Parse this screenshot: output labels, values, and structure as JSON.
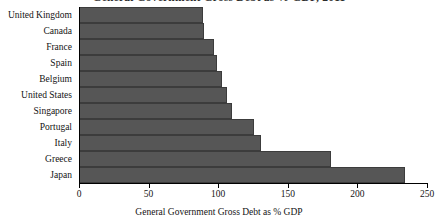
{
  "chart_data": {
    "type": "bar",
    "orientation": "horizontal",
    "title": "General Government Gross Debt as % GDP, 2011",
    "title_clipped": true,
    "categories": [
      "United Kingdom",
      "Canada",
      "France",
      "Spain",
      "Belgium",
      "United States",
      "Singapore",
      "Portugal",
      "Italy",
      "Greece",
      "Japan"
    ],
    "values": [
      89,
      90,
      97,
      99,
      103,
      106,
      110,
      126,
      131,
      181,
      234
    ],
    "xlabel": "General Government Gross Debt as % GDP",
    "ylabel": "",
    "xlim": [
      0,
      250
    ],
    "xticks": [
      0,
      50,
      100,
      150,
      200,
      250
    ],
    "xtick_labels": [
      "0",
      "50",
      "100",
      "150",
      "200",
      "250"
    ],
    "grid": false,
    "legend": false,
    "bar_color": "#565656",
    "bar_edge_color": "#3c3c3c",
    "axis_color": "#000000",
    "background_color": "#ffffff"
  }
}
